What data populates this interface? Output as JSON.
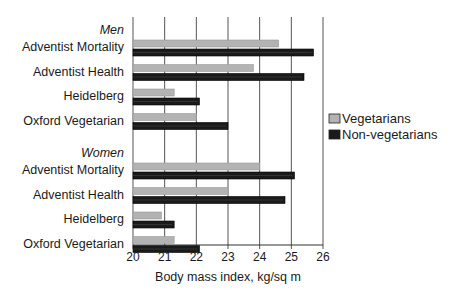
{
  "chart_data": {
    "type": "bar",
    "orientation": "horizontal",
    "title": "",
    "xlabel": "Body mass index, kg/sq m",
    "ylabel": "",
    "xlim": [
      20,
      26
    ],
    "xticks": [
      20,
      21,
      22,
      23,
      24,
      25,
      26
    ],
    "grid": "vertical",
    "legend_position": "right",
    "groups": [
      {
        "label": "Men",
        "categories": [
          "Adventist Mortality",
          "Adventist Health",
          "Heidelberg",
          "Oxford Vegetarian"
        ]
      },
      {
        "label": "Women",
        "categories": [
          "Adventist Mortality",
          "Adventist Health",
          "Heidelberg",
          "Oxford Vegetarian"
        ]
      }
    ],
    "series": [
      {
        "name": "Vegetarians",
        "color": "#b3b3b3",
        "values": [
          [
            24.6,
            23.8,
            21.3,
            22.0
          ],
          [
            24.0,
            23.0,
            20.9,
            21.3
          ]
        ]
      },
      {
        "name": "Non-vegetarians",
        "color": "#1a1a1a",
        "values": [
          [
            25.7,
            25.4,
            22.1,
            23.0
          ],
          [
            25.1,
            24.8,
            21.3,
            22.1
          ]
        ]
      }
    ]
  }
}
